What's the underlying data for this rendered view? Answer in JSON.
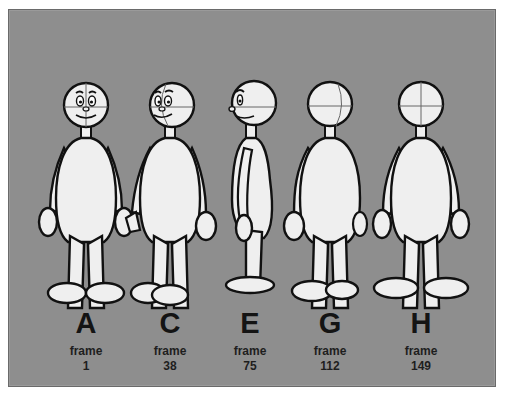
{
  "figure": {
    "background_color": "#8e8e8e",
    "figure_fill": "#efefef",
    "outline_color": "#111111",
    "poses": [
      {
        "letter": "A",
        "frame_label": "frame",
        "frame_number": "1",
        "view": "front"
      },
      {
        "letter": "C",
        "frame_label": "frame",
        "frame_number": "38",
        "view": "three-quarter-front"
      },
      {
        "letter": "E",
        "frame_label": "frame",
        "frame_number": "75",
        "view": "profile"
      },
      {
        "letter": "G",
        "frame_label": "frame",
        "frame_number": "112",
        "view": "three-quarter-back"
      },
      {
        "letter": "H",
        "frame_label": "frame",
        "frame_number": "149",
        "view": "back"
      }
    ]
  }
}
